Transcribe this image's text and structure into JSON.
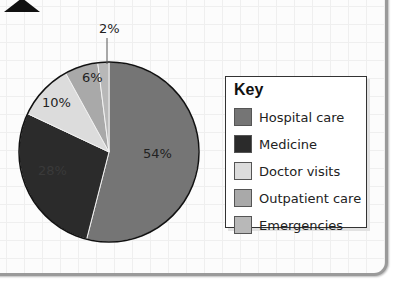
{
  "chart_data": {
    "type": "pie",
    "title": "",
    "categories": [
      "Hospital care",
      "Medicine",
      "Doctor visits",
      "Outpatient care",
      "Emergencies"
    ],
    "values": [
      54,
      28,
      10,
      6,
      2
    ],
    "labels": [
      "54%",
      "28%",
      "10%",
      "6%",
      "2%"
    ],
    "colors": [
      "#757575",
      "#2b2b2b",
      "#dcdcdc",
      "#a9a9a9",
      "#b8b8b8"
    ],
    "legend_position": "right",
    "legend_title": "Key"
  },
  "key": {
    "title": "Key",
    "items": [
      {
        "label": "Hospital care",
        "color": "#757575"
      },
      {
        "label": "Medicine",
        "color": "#2b2b2b"
      },
      {
        "label": "Doctor visits",
        "color": "#dcdcdc"
      },
      {
        "label": "Outpatient care",
        "color": "#a9a9a9"
      },
      {
        "label": "Emergencies",
        "color": "#b8b8b8"
      }
    ]
  },
  "slice_labels": {
    "hospital": "54%",
    "medicine": "28%",
    "doctor": "10%",
    "outpatient": "6%",
    "emergencies": "2%"
  }
}
